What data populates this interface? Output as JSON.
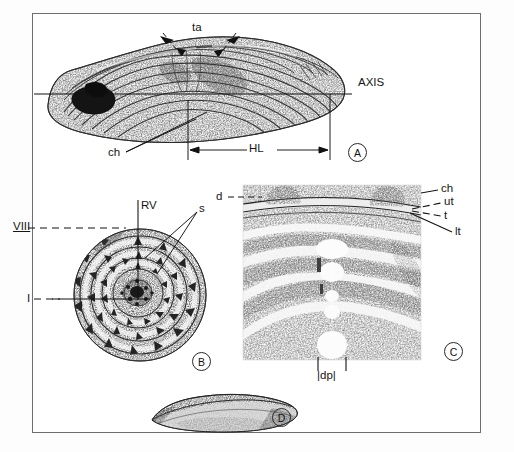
{
  "figure": {
    "kind": "scientific-illustration-plate",
    "panel_count": 4,
    "background_color": "#ffffff",
    "ink_color": "#161616",
    "frame_color": "#6e6e6e"
  },
  "panels": [
    {
      "key": "A",
      "name": "lateral-view",
      "description": "Stippled lateral view of elongate otolith with concentric growth increments, dark nucleus region at left and growth axis line running horizontally."
    },
    {
      "key": "B",
      "name": "proximal-face-view",
      "description": "Circular concentric view with radial tubercles/spines arranged in rings around a dark granular focus."
    },
    {
      "key": "C",
      "name": "sectioned-detail",
      "description": "Magnified stippled section showing nested arc-shaped growth bands with pale pores along the midline."
    },
    {
      "key": "D",
      "name": "edge-profile-view",
      "description": "Small shaded profile of the whole structure viewed edge-on."
    }
  ],
  "labels": {
    "panel_a": [
      {
        "text": "ta",
        "role": "structure-label",
        "leader": "double-arrow"
      },
      {
        "text": "AXIS",
        "role": "axis-label",
        "leader": "horizontal-line"
      },
      {
        "text": "ch",
        "role": "structure-label",
        "leader": "double-line"
      },
      {
        "text": "HL",
        "role": "measurement-label",
        "leader": "dimension-arrow"
      }
    ],
    "panel_b": [
      {
        "text": "VIII",
        "role": "annulus-label",
        "leader": "dashed",
        "underlined": true
      },
      {
        "text": "RV",
        "role": "axis-label",
        "leader": "vertical-line"
      },
      {
        "text": "s",
        "role": "structure-label",
        "leader": "double-line"
      },
      {
        "text": "I",
        "role": "annulus-label",
        "leader": "dashed"
      }
    ],
    "panel_c": [
      {
        "text": "d",
        "role": "structure-label",
        "leader": "dashed"
      },
      {
        "text": "ch",
        "role": "structure-label",
        "leader": "solid"
      },
      {
        "text": "ut",
        "role": "structure-label",
        "leader": "dashed"
      },
      {
        "text": "t",
        "role": "structure-label",
        "leader": "dashed"
      },
      {
        "text": "lt",
        "role": "structure-label",
        "leader": "solid"
      },
      {
        "text": "dp",
        "role": "measurement-label",
        "leader": "bracket-ticks"
      }
    ],
    "panel_keys": [
      "A",
      "B",
      "C",
      "D"
    ]
  },
  "measurements": [
    {
      "abbr": "HL",
      "panel": "A",
      "style": "double-headed-arrow-between-ticks"
    },
    {
      "abbr": "dp",
      "panel": "C",
      "style": "vertical-tick-pair"
    }
  ]
}
